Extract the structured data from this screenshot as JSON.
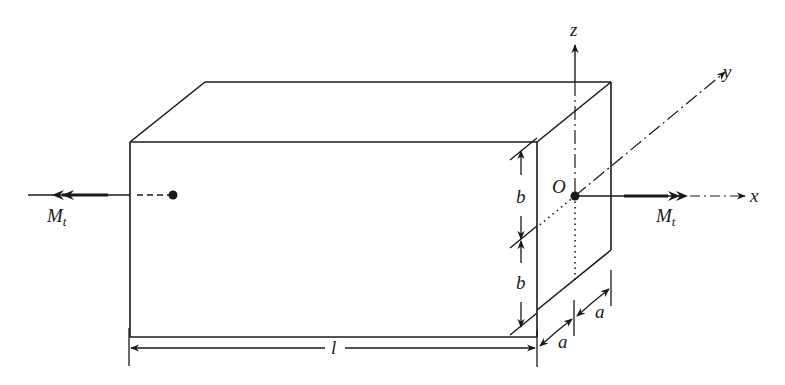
{
  "figure": {
    "type": "prismatic bar under torsion",
    "labels": {
      "moment_left": "M",
      "moment_left_sub": "t",
      "moment_right": "M",
      "moment_right_sub": "t",
      "origin": "O",
      "axis_x": "x",
      "axis_y": "y",
      "axis_z": "z",
      "half_height_top": "b",
      "half_height_bottom": "b",
      "half_width_front": "a",
      "half_width_back": "a",
      "length": "l"
    },
    "colors": {
      "stroke": "#1a1a1a",
      "background": "#ffffff"
    }
  }
}
